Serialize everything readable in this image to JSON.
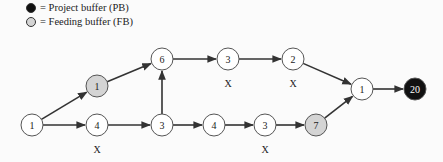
{
  "legend": {
    "items": [
      {
        "label": "= Project buffer (PB)",
        "color": "#111111"
      },
      {
        "label": "= Feeding buffer (FB)",
        "color": "#d4d4d4"
      }
    ]
  },
  "diagram": {
    "nodes": [
      {
        "id": "n1",
        "label": "1",
        "x": 32,
        "y": 125,
        "type": "task"
      },
      {
        "id": "n2",
        "label": "1",
        "x": 97,
        "y": 86,
        "type": "feeding-buffer"
      },
      {
        "id": "n3",
        "label": "4",
        "x": 97,
        "y": 125,
        "type": "task",
        "mark": "X"
      },
      {
        "id": "n4",
        "label": "6",
        "x": 162,
        "y": 59,
        "type": "task"
      },
      {
        "id": "n5",
        "label": "3",
        "x": 228,
        "y": 59,
        "type": "task",
        "mark": "X"
      },
      {
        "id": "n6",
        "label": "2",
        "x": 293,
        "y": 59,
        "type": "task",
        "mark": "X"
      },
      {
        "id": "n7",
        "label": "3",
        "x": 162,
        "y": 125,
        "type": "task"
      },
      {
        "id": "n8",
        "label": "4",
        "x": 214,
        "y": 125,
        "type": "task"
      },
      {
        "id": "n9",
        "label": "3",
        "x": 265,
        "y": 125,
        "type": "task",
        "mark": "X"
      },
      {
        "id": "n10",
        "label": "7",
        "x": 316,
        "y": 125,
        "type": "feeding-buffer"
      },
      {
        "id": "n11",
        "label": "1",
        "x": 362,
        "y": 89,
        "type": "task"
      },
      {
        "id": "n12",
        "label": "20",
        "x": 415,
        "y": 89,
        "type": "project-buffer"
      }
    ],
    "edges": [
      [
        "n1",
        "n2"
      ],
      [
        "n1",
        "n3"
      ],
      [
        "n2",
        "n4"
      ],
      [
        "n3",
        "n7"
      ],
      [
        "n7",
        "n4"
      ],
      [
        "n4",
        "n5"
      ],
      [
        "n5",
        "n6"
      ],
      [
        "n6",
        "n11"
      ],
      [
        "n7",
        "n8"
      ],
      [
        "n8",
        "n9"
      ],
      [
        "n9",
        "n10"
      ],
      [
        "n10",
        "n11"
      ],
      [
        "n11",
        "n12"
      ]
    ],
    "critical_mark": "X",
    "colors": {
      "task_fill": "#ffffff",
      "feeding_buffer_fill": "#d4d4d4",
      "project_buffer_fill": "#111111",
      "stroke": "#333333"
    }
  }
}
